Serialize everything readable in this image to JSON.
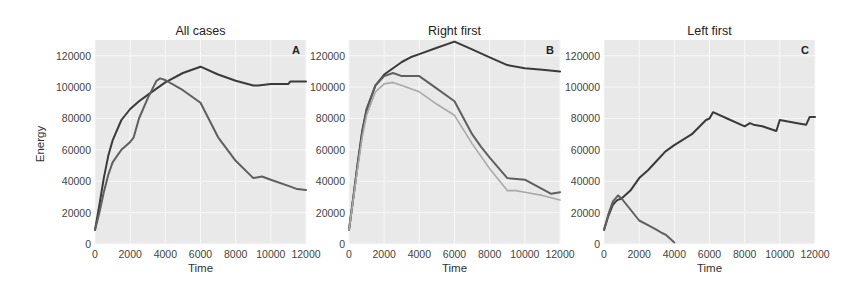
{
  "figure": {
    "ylabel": "Energy",
    "background": "#ffffff",
    "plot_background": "#e9e9e9",
    "grid_color": "#f8f8f8",
    "line_colors": {
      "dark": "#3a3a3a",
      "medium": "#5f5f5f",
      "light": "#a9a9a9"
    }
  },
  "chart_data": [
    {
      "type": "line",
      "title": "All cases",
      "panel_label": "A",
      "xlabel": "Time",
      "ylabel": "Energy",
      "xlim": [
        0,
        12000
      ],
      "ylim": [
        0,
        130000
      ],
      "xticks": [
        0,
        2000,
        4000,
        6000,
        8000,
        10000,
        12000
      ],
      "yticks": [
        0,
        20000,
        40000,
        60000,
        80000,
        100000,
        120000
      ],
      "grid": true,
      "series": [
        {
          "name": "series-1",
          "color": "dark",
          "x": [
            0,
            250,
            500,
            750,
            1000,
            1500,
            2000,
            2500,
            3000,
            3500,
            4000,
            5000,
            6000,
            7000,
            8000,
            9000,
            9300,
            10000,
            11000,
            11100,
            12000
          ],
          "y": [
            9000,
            25000,
            42000,
            56000,
            66000,
            79000,
            86000,
            91000,
            95000,
            99000,
            103000,
            109000,
            113000,
            108000,
            104000,
            101000,
            101000,
            102000,
            102000,
            103500,
            103500
          ]
        },
        {
          "name": "series-2",
          "color": "medium",
          "x": [
            0,
            250,
            500,
            750,
            1000,
            1500,
            2000,
            2200,
            2500,
            3000,
            3500,
            3700,
            4000,
            5000,
            6000,
            7000,
            8000,
            9000,
            9500,
            10000,
            11000,
            11500,
            12000
          ],
          "y": [
            9000,
            20000,
            33000,
            44000,
            52000,
            60000,
            65000,
            68000,
            80000,
            93000,
            104000,
            105500,
            104500,
            98000,
            90000,
            68000,
            53000,
            42000,
            43000,
            41000,
            37000,
            35000,
            34500
          ]
        }
      ]
    },
    {
      "type": "line",
      "title": "Right first",
      "panel_label": "B",
      "xlabel": "Time",
      "ylabel": "",
      "xlim": [
        0,
        12000
      ],
      "ylim": [
        0,
        130000
      ],
      "xticks": [
        0,
        2000,
        4000,
        6000,
        8000,
        10000,
        12000
      ],
      "yticks": [
        0,
        20000,
        40000,
        60000,
        80000,
        100000,
        120000
      ],
      "grid": true,
      "series": [
        {
          "name": "series-1",
          "color": "dark",
          "x": [
            0,
            250,
            500,
            750,
            1000,
            1500,
            2000,
            2500,
            3000,
            3500,
            4000,
            5000,
            6000,
            7000,
            8000,
            9000,
            10000,
            11000,
            12000
          ],
          "y": [
            9000,
            30000,
            52000,
            72000,
            86000,
            101000,
            108000,
            112000,
            116000,
            119000,
            121000,
            125000,
            129000,
            124000,
            119000,
            114000,
            112000,
            111000,
            110000
          ]
        },
        {
          "name": "series-2",
          "color": "medium",
          "x": [
            0,
            250,
            500,
            750,
            1000,
            1500,
            2000,
            2500,
            3000,
            4000,
            5000,
            6000,
            7000,
            7500,
            8000,
            9000,
            10000,
            11000,
            11500,
            12000
          ],
          "y": [
            9000,
            30000,
            51000,
            71000,
            85000,
            101000,
            107000,
            109000,
            107000,
            107000,
            99000,
            91000,
            70000,
            62000,
            55000,
            42000,
            41000,
            35000,
            32000,
            33000
          ]
        },
        {
          "name": "series-3",
          "color": "light",
          "x": [
            0,
            250,
            500,
            750,
            1000,
            1500,
            2000,
            2500,
            3000,
            4000,
            5000,
            6000,
            7000,
            8000,
            9000,
            9500,
            10000,
            11000,
            12000
          ],
          "y": [
            9000,
            29000,
            49000,
            68000,
            82000,
            97000,
            102000,
            103000,
            101000,
            97000,
            89000,
            82000,
            64000,
            48000,
            34000,
            34000,
            33000,
            31000,
            28000
          ]
        }
      ]
    },
    {
      "type": "line",
      "title": "Left first",
      "panel_label": "C",
      "xlabel": "Time",
      "ylabel": "",
      "xlim": [
        0,
        12000
      ],
      "ylim": [
        0,
        130000
      ],
      "xticks": [
        0,
        2000,
        4000,
        6000,
        8000,
        10000,
        12000
      ],
      "yticks": [
        0,
        20000,
        40000,
        60000,
        80000,
        100000,
        120000
      ],
      "grid": true,
      "series": [
        {
          "name": "series-1",
          "color": "dark",
          "x": [
            0,
            250,
            500,
            750,
            1000,
            1500,
            2000,
            2500,
            3000,
            3500,
            4000,
            5000,
            5800,
            6000,
            6200,
            7000,
            8000,
            8300,
            8500,
            9000,
            9800,
            10000,
            11000,
            11500,
            11700,
            12000
          ],
          "y": [
            9000,
            18000,
            25000,
            28000,
            29000,
            34000,
            42000,
            47000,
            53000,
            59000,
            63000,
            70000,
            79000,
            80000,
            84000,
            80000,
            75000,
            77000,
            76000,
            75000,
            72000,
            79000,
            77000,
            76000,
            81000,
            81000
          ]
        },
        {
          "name": "series-2",
          "color": "medium",
          "x": [
            0,
            250,
            500,
            800,
            1000,
            1500,
            2000,
            2500,
            3000,
            3300,
            3500,
            3800,
            4000
          ],
          "y": [
            9000,
            19000,
            27000,
            31000,
            29000,
            22000,
            15000,
            12000,
            9000,
            7000,
            6000,
            3000,
            1000
          ]
        }
      ]
    }
  ]
}
